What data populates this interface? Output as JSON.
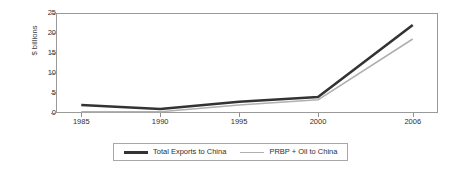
{
  "chart_data": {
    "type": "line",
    "title": "",
    "xlabel": "",
    "ylabel": "$ billions",
    "categories": [
      "1985",
      "1990",
      "1995",
      "2000",
      "2006"
    ],
    "x": [
      1985,
      1990,
      1995,
      2000,
      2006
    ],
    "xlim": [
      1983.4,
      2007.6
    ],
    "ylim": [
      0,
      25
    ],
    "yticks": [
      "0",
      "5",
      "10",
      "15",
      "20",
      "25"
    ],
    "ytick_values": [
      0,
      5,
      10,
      15,
      20,
      25
    ],
    "grid": false,
    "legend_position": "bottom-center",
    "series": [
      {
        "name": "Total Exports to China",
        "color": "#333333",
        "width": 2.6,
        "values": [
          2.0,
          1.0,
          2.8,
          4.0,
          22.0
        ]
      },
      {
        "name": "PRBP + Oil to China",
        "color": "#b0b0b0",
        "width": 1.6,
        "values": [
          0.3,
          0.3,
          2.0,
          3.3,
          18.5
        ]
      }
    ]
  },
  "axis": {
    "y_title": "$ billions"
  },
  "legend": {
    "entries": [
      {
        "label": "Total Exports to China"
      },
      {
        "label": "PRBP + Oil to China"
      }
    ]
  }
}
